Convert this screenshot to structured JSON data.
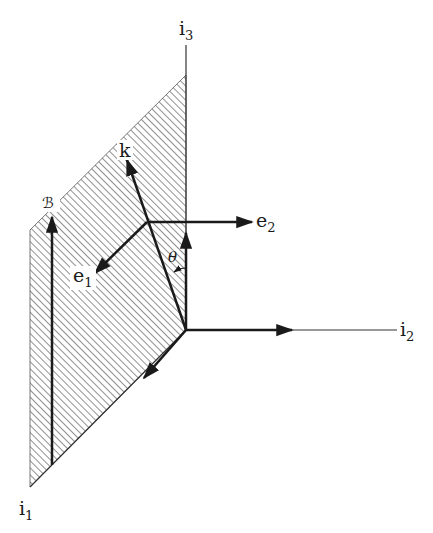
{
  "figure": {
    "type": "3D vector diagram",
    "colors": {
      "ink": "#1a1a1a",
      "hatch": "#555555",
      "background": "#ffffff"
    },
    "axes": [
      {
        "id": "i1",
        "base": "i",
        "sub": "1"
      },
      {
        "id": "i2",
        "base": "i",
        "sub": "2"
      },
      {
        "id": "i3",
        "base": "i",
        "sub": "3"
      }
    ],
    "vectors": [
      {
        "id": "k",
        "label": "k"
      },
      {
        "id": "e1",
        "base": "e",
        "sub": "1"
      },
      {
        "id": "e2",
        "base": "e",
        "sub": "2"
      },
      {
        "id": "B",
        "label": "ℬ"
      }
    ],
    "angle": {
      "label": "θ"
    },
    "plane": {
      "description": "hatched plane spanned by i1 and i3"
    }
  }
}
